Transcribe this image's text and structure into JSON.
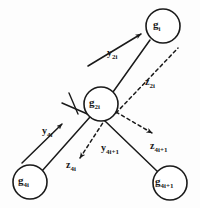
{
  "figure": {
    "type": "diagram",
    "background_color": "#fdfdfd",
    "ink_color": "#1a1a1a"
  },
  "nodes": [
    {
      "id": "gi",
      "base": "g",
      "subscript": "i",
      "cx": 163,
      "cy": 26,
      "r": 17
    },
    {
      "id": "g2i",
      "base": "g",
      "subscript": "2i",
      "cx": 101,
      "cy": 104,
      "r": 17
    },
    {
      "id": "g4i",
      "base": "g",
      "subscript": "4i",
      "cx": 30,
      "cy": 182,
      "r": 17
    },
    {
      "id": "g4i1",
      "base": "g",
      "subscript": "4i+1",
      "cx": 170,
      "cy": 183,
      "r": 17
    }
  ],
  "axis_labels": [
    {
      "id": "y2i",
      "base": "y",
      "subscript": "2i",
      "x": 107,
      "y": 48,
      "style": "solid"
    },
    {
      "id": "z2i",
      "base": "z",
      "subscript": "2i",
      "x": 145,
      "y": 77,
      "style": "dashed"
    },
    {
      "id": "y4i",
      "base": "y",
      "subscript": "4i",
      "x": 42,
      "y": 126,
      "style": "solid"
    },
    {
      "id": "z4i1",
      "base": "z",
      "subscript": "4i+1",
      "x": 150,
      "y": 141,
      "style": "dashed"
    },
    {
      "id": "y4i1",
      "base": "y",
      "subscript": "4i+1",
      "x": 101,
      "y": 143,
      "style": "solid"
    },
    {
      "id": "z4i",
      "base": "z",
      "subscript": "4i",
      "x": 66,
      "y": 160,
      "style": "dashed"
    }
  ],
  "edges": [
    {
      "name": "edge-g2i-to-gi",
      "from": "g2i",
      "to": "gi",
      "style": "solid"
    },
    {
      "name": "edge-g2i-to-g4i",
      "from": "g2i",
      "to": "g4i",
      "style": "solid"
    },
    {
      "name": "edge-g2i-to-g4i1",
      "from": "g2i",
      "to": "g4i1",
      "style": "solid"
    }
  ],
  "vectors": [
    {
      "name": "vector-y2i",
      "style": "solid",
      "direction": "up-right"
    },
    {
      "name": "vector-z2i",
      "style": "dashed",
      "direction": "up-right"
    },
    {
      "name": "vector-y4i",
      "style": "solid",
      "direction": "up-right"
    },
    {
      "name": "vector-z4i",
      "style": "dashed",
      "direction": "down-left"
    },
    {
      "name": "vector-z4i1",
      "style": "dashed",
      "direction": "down-right"
    }
  ],
  "marks": [
    {
      "name": "right-angle-mark",
      "description": "perpendicular tick at branch junction"
    }
  ]
}
